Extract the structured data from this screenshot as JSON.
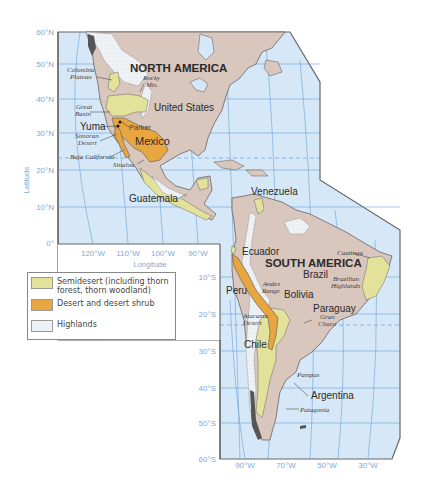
{
  "map": {
    "title": "Desert and Semidesert Regions of the Americas",
    "continents": [
      {
        "id": "na",
        "label": "NORTH AMERICA"
      },
      {
        "id": "sa",
        "label": "SOUTH AMERICA"
      }
    ],
    "countries": {
      "united_states": "United States",
      "mexico": "Mexico",
      "guatemala": "Guatemala",
      "venezuela": "Venezuela",
      "ecuador": "Ecuador",
      "brazil": "Brazil",
      "peru": "Peru",
      "bolivia": "Bolivia",
      "paraguay": "Paraguay",
      "chile": "Chile",
      "argentina": "Argentina",
      "yuma": "Yuma",
      "parker": "Parker"
    },
    "places": {
      "columbia_plateau_1": "Columbia",
      "columbia_plateau_2": "Plateau",
      "rocky_1": "Rocky",
      "rocky_2": "Mts.",
      "great_basin_1": "Great",
      "great_basin_2": "Basin",
      "sonoran_1": "Sonoran",
      "sonoran_2": "Desert",
      "baja": "Baja California",
      "sinaloa": "Sinaloa",
      "caatinga": "Caatinga",
      "brazilian_highlands_1": "Brazilian",
      "brazilian_highlands_2": "Highlands",
      "andes_1": "Andes",
      "andes_2": "Range",
      "atacama_1": "Atacama",
      "atacama_2": "Desert",
      "gran_chaco_1": "Gran",
      "gran_chaco_2": "Chaco",
      "pampas": "Pampas",
      "patagonia": "Patagonia"
    },
    "axes": {
      "latitude_label": "Latitude",
      "longitude_label": "Longitude",
      "north_lat_ticks": [
        "60°N",
        "50°N",
        "40°N",
        "30°N",
        "20°N",
        "10°N",
        "0°"
      ],
      "north_lon_ticks": [
        "120°W",
        "110°W",
        "100°W",
        "90°W"
      ],
      "south_lat_ticks": [
        "10°S",
        "20°S",
        "30°S",
        "40°S",
        "50°S",
        "60°S"
      ],
      "south_lon_ticks": [
        "90°W",
        "70°W",
        "50°W",
        "30°W"
      ]
    },
    "colors": {
      "ocean": "#d6e8f8",
      "land": "#d9c6bd",
      "semidesert": "#e3e29a",
      "desert": "#e8a640",
      "highlands": "#eef2f5",
      "grid": "#6a9fd4",
      "frame": "#666666"
    }
  },
  "legend": {
    "items": [
      {
        "label": "Semidesert (including thorn forest, thorn woodland)",
        "color": "#e3e29a"
      },
      {
        "label": "Desert and desert shrub",
        "color": "#e8a640"
      },
      {
        "label": "Highlands",
        "color": "#eef2f5"
      }
    ]
  }
}
